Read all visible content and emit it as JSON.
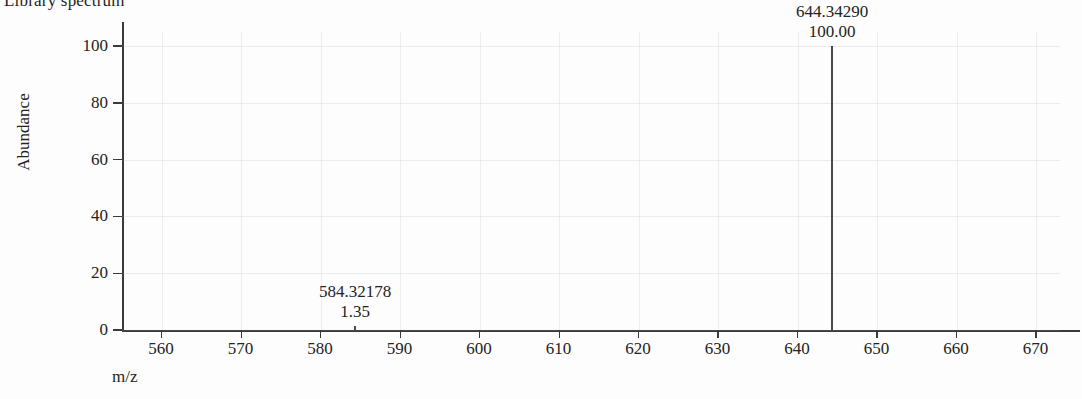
{
  "chart_data": {
    "type": "bar",
    "title": "Library spectrum",
    "xlabel": "m/z",
    "ylabel": "Abundance",
    "xlim": [
      555,
      673
    ],
    "ylim": [
      0,
      105
    ],
    "xticks": [
      560,
      570,
      580,
      590,
      600,
      610,
      620,
      630,
      640,
      650,
      660,
      670
    ],
    "yticks": [
      0,
      20,
      40,
      60,
      80,
      100
    ],
    "grid": true,
    "legend": null,
    "x": [
      584.32178,
      644.3429
    ],
    "values": [
      1.35,
      100.0
    ],
    "series": [
      {
        "name": "Library spectrum",
        "points": [
          {
            "mz": "584.32178",
            "intensity": "1.35",
            "mz_value": 584.32178,
            "intensity_value": 1.35
          },
          {
            "mz": "644.34290",
            "intensity": "100.00",
            "mz_value": 644.3429,
            "intensity_value": 100.0
          }
        ]
      }
    ],
    "annotations": [
      {
        "mz": "584.32178",
        "intensity": "1.35"
      },
      {
        "mz": "644.34290",
        "intensity": "100.00"
      }
    ],
    "colors": {
      "peak": "#4a4a4a",
      "axis": "#3a3a3a",
      "text": "#232323",
      "grid": "#9a9a9a",
      "background": "#fdfdfd"
    }
  }
}
